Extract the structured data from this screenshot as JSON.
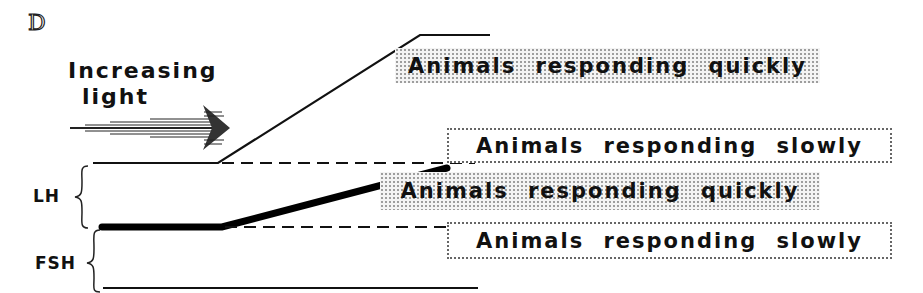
{
  "figure": {
    "panel_label": "D",
    "stimulus_label_line1": "Increasing",
    "stimulus_label_line2": "light",
    "hormones": [
      {
        "abbrev": "LH"
      },
      {
        "abbrev": "FSH"
      }
    ],
    "boxes": [
      {
        "text": "Animals responding quickly",
        "style": "shaded",
        "hormone": "LH"
      },
      {
        "text": "Animals responding slowly",
        "style": "dotted",
        "hormone": "LH"
      },
      {
        "text": "Animals responding quickly",
        "style": "shaded",
        "hormone": "FSH"
      },
      {
        "text": "Animals responding slowly",
        "style": "dotted",
        "hormone": "FSH"
      }
    ]
  }
}
